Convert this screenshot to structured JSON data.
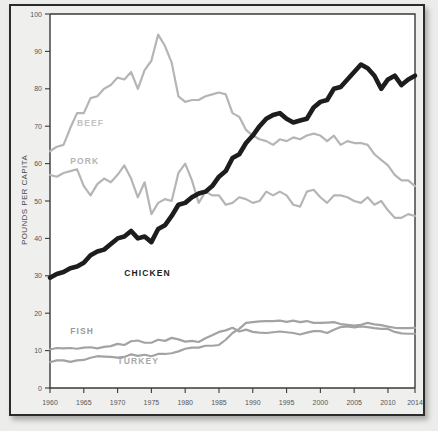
{
  "chart_data": {
    "type": "line",
    "title": "",
    "subtitle": "",
    "xlabel": "",
    "ylabel": "POUNDS PER CAPITA",
    "xlim": [
      1960,
      2014
    ],
    "ylim": [
      0,
      100
    ],
    "grid": false,
    "legend_position": "inline-labels",
    "x_tick_labels": [
      "1960",
      "1965",
      "1970",
      "1975",
      "1980",
      "1985",
      "1990",
      "1995",
      "2000",
      "2005",
      "2010",
      "2014"
    ],
    "x_ticks": [
      1960,
      1965,
      1970,
      1975,
      1980,
      1985,
      1990,
      1995,
      2000,
      2005,
      2010,
      2014
    ],
    "y_tick_labels": [
      "0",
      "10",
      "20",
      "30",
      "40",
      "50",
      "60",
      "70",
      "80",
      "90",
      "100"
    ],
    "y_ticks": [
      0,
      10,
      20,
      30,
      40,
      50,
      60,
      70,
      80,
      90,
      100
    ],
    "x": [
      1960,
      1961,
      1962,
      1963,
      1964,
      1965,
      1966,
      1967,
      1968,
      1969,
      1970,
      1971,
      1972,
      1973,
      1974,
      1975,
      1976,
      1977,
      1978,
      1979,
      1980,
      1981,
      1982,
      1983,
      1984,
      1985,
      1986,
      1987,
      1988,
      1989,
      1990,
      1991,
      1992,
      1993,
      1994,
      1995,
      1996,
      1997,
      1998,
      1999,
      2000,
      2001,
      2002,
      2003,
      2004,
      2005,
      2006,
      2007,
      2008,
      2009,
      2010,
      2011,
      2012,
      2013,
      2014
    ],
    "series": [
      {
        "name": "BEEF",
        "color": "#b5b5b5",
        "label_x": 1964,
        "label_y": 70,
        "values": [
          63.3,
          64.5,
          65.0,
          69.5,
          73.5,
          73.5,
          77.5,
          78.0,
          80.0,
          81.0,
          83.0,
          82.5,
          84.5,
          80.0,
          85.0,
          87.5,
          94.5,
          91.5,
          87.0,
          78.0,
          76.5,
          77.0,
          77.0,
          78.0,
          78.5,
          79.0,
          78.5,
          73.5,
          72.5,
          69.0,
          67.5,
          66.5,
          66.0,
          65.0,
          66.5,
          66.0,
          67.0,
          66.5,
          67.5,
          68.0,
          67.5,
          66.0,
          67.5,
          65.0,
          66.0,
          65.5,
          65.5,
          65.0,
          62.5,
          61.0,
          59.5,
          57.0,
          55.5,
          55.5,
          54.0
        ]
      },
      {
        "name": "PORK",
        "color": "#b5b5b5",
        "label_x": 1963,
        "label_y": 60,
        "values": [
          57.0,
          56.5,
          57.5,
          58.0,
          58.5,
          54.0,
          51.5,
          54.5,
          56.0,
          55.0,
          57.0,
          59.5,
          56.0,
          51.0,
          55.0,
          46.5,
          49.5,
          50.5,
          50.0,
          57.5,
          60.0,
          55.5,
          49.5,
          52.5,
          51.5,
          51.5,
          49.0,
          49.5,
          51.0,
          50.5,
          49.5,
          50.0,
          52.5,
          51.5,
          52.5,
          51.5,
          49.0,
          48.5,
          52.5,
          53.0,
          51.0,
          49.5,
          51.5,
          51.5,
          51.0,
          50.0,
          49.5,
          51.0,
          49.0,
          50.0,
          47.5,
          45.5,
          45.5,
          46.5,
          46.0
        ]
      },
      {
        "name": "CHICKEN",
        "color": "#1d1d1d",
        "label_x": 1971,
        "label_y": 30,
        "values": [
          29.5,
          30.5,
          31.0,
          32.0,
          32.5,
          33.5,
          35.5,
          36.5,
          37.0,
          38.5,
          40.0,
          40.5,
          42.0,
          40.0,
          40.5,
          39.0,
          42.5,
          43.5,
          46.0,
          49.0,
          49.5,
          51.0,
          52.0,
          52.5,
          54.0,
          56.5,
          58.0,
          61.5,
          62.5,
          65.5,
          67.5,
          70.0,
          72.0,
          73.0,
          73.5,
          72.0,
          71.0,
          71.5,
          72.0,
          75.0,
          76.5,
          77.0,
          80.0,
          80.5,
          82.5,
          84.5,
          86.5,
          85.5,
          83.5,
          80.0,
          82.5,
          83.5,
          81.0,
          82.5,
          83.5
        ]
      },
      {
        "name": "FISH",
        "color": "#a3a3a3",
        "label_x": 1963,
        "label_y": 14.5,
        "values": [
          10.3,
          10.7,
          10.6,
          10.7,
          10.5,
          10.8,
          10.9,
          10.6,
          11.0,
          11.2,
          11.8,
          11.5,
          12.5,
          12.7,
          12.1,
          12.1,
          12.9,
          12.6,
          13.4,
          13.0,
          12.4,
          12.6,
          12.3,
          13.3,
          14.1,
          15.0,
          15.4,
          16.1,
          15.1,
          15.6,
          15.0,
          14.8,
          14.7,
          14.9,
          15.1,
          14.9,
          14.7,
          14.3,
          14.8,
          15.2,
          15.2,
          14.7,
          15.6,
          16.3,
          16.5,
          16.2,
          16.5,
          16.3,
          16.0,
          15.8,
          15.8,
          15.0,
          14.6,
          14.5,
          14.5
        ]
      },
      {
        "name": "TURKEY",
        "color": "#a3a3a3",
        "label_x": 1970,
        "label_y": 6.5,
        "values": [
          6.9,
          7.4,
          7.4,
          7.0,
          7.4,
          7.5,
          8.1,
          8.5,
          8.4,
          8.3,
          8.1,
          8.3,
          9.0,
          8.6,
          8.9,
          8.5,
          9.1,
          9.1,
          9.3,
          9.8,
          10.5,
          10.8,
          10.8,
          11.3,
          11.3,
          11.5,
          12.9,
          14.7,
          15.8,
          17.4,
          17.6,
          17.8,
          17.9,
          17.9,
          18.0,
          17.7,
          18.0,
          17.6,
          17.9,
          17.4,
          17.4,
          17.5,
          17.6,
          17.1,
          16.9,
          16.7,
          16.9,
          17.4,
          17.0,
          16.8,
          16.4,
          16.1,
          16.0,
          16.0,
          16.1
        ]
      }
    ]
  },
  "axis": {
    "y_title": "POUNDS PER CAPITA"
  },
  "labels": {
    "beef": "BEEF",
    "pork": "PORK",
    "chicken": "CHICKEN",
    "fish": "FISH",
    "turkey": "TURKEY"
  }
}
